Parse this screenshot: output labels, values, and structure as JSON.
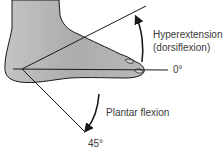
{
  "diagram": {
    "labels": {
      "hyperextension_line1": "Hyperextension",
      "hyperextension_line2": "(dorsiflexion)",
      "zero_degree": "0°",
      "plantar_flexion": "Plantar flexion",
      "forty_five_degree": "45°"
    },
    "colors": {
      "foot_fill": "#b4b4b4",
      "outline": "#1a1a1a",
      "text": "#3a3a3a",
      "background": "#ffffff"
    }
  }
}
